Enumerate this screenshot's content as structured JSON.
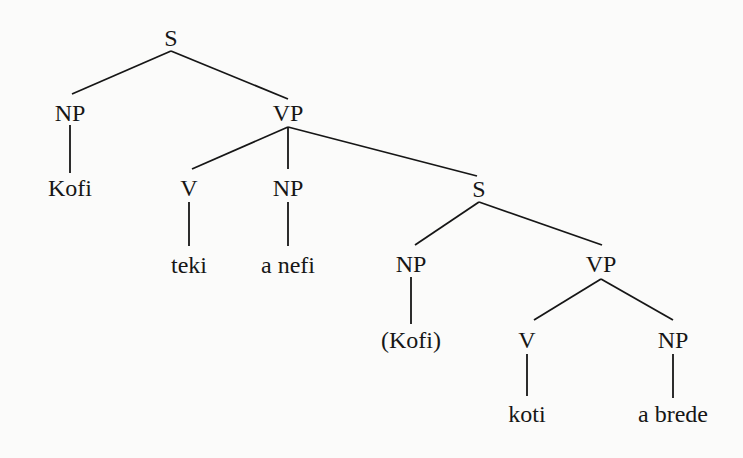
{
  "tree": {
    "nodes": [
      {
        "id": "s1",
        "label": "S",
        "x": 171,
        "y": 38
      },
      {
        "id": "np1",
        "label": "NP",
        "x": 70,
        "y": 113
      },
      {
        "id": "vp1",
        "label": "VP",
        "x": 288,
        "y": 113
      },
      {
        "id": "kofi1",
        "label": "Kofi",
        "x": 70,
        "y": 188
      },
      {
        "id": "v1",
        "label": "V",
        "x": 189,
        "y": 188
      },
      {
        "id": "np2",
        "label": "NP",
        "x": 288,
        "y": 188
      },
      {
        "id": "s2",
        "label": "S",
        "x": 479,
        "y": 189
      },
      {
        "id": "teki",
        "label": "teki",
        "x": 189,
        "y": 265
      },
      {
        "id": "anefi",
        "label": "a nefi",
        "x": 288,
        "y": 265
      },
      {
        "id": "np3",
        "label": "NP",
        "x": 411,
        "y": 264
      },
      {
        "id": "vp2",
        "label": "VP",
        "x": 601,
        "y": 264
      },
      {
        "id": "kofi2",
        "label": "(Kofi)",
        "x": 411,
        "y": 340
      },
      {
        "id": "v2",
        "label": "V",
        "x": 527,
        "y": 340
      },
      {
        "id": "np4",
        "label": "NP",
        "x": 673,
        "y": 340
      },
      {
        "id": "koti",
        "label": "koti",
        "x": 527,
        "y": 414
      },
      {
        "id": "abrede",
        "label": "a brede",
        "x": 673,
        "y": 414
      }
    ],
    "edges": [
      {
        "x1": 171,
        "y1": 51,
        "x2": 72,
        "y2": 94
      },
      {
        "x1": 171,
        "y1": 51,
        "x2": 288,
        "y2": 99
      },
      {
        "x1": 70,
        "y1": 125,
        "x2": 70,
        "y2": 173
      },
      {
        "x1": 288,
        "y1": 127,
        "x2": 192,
        "y2": 169
      },
      {
        "x1": 288,
        "y1": 127,
        "x2": 288,
        "y2": 169
      },
      {
        "x1": 288,
        "y1": 127,
        "x2": 477,
        "y2": 176
      },
      {
        "x1": 189,
        "y1": 202,
        "x2": 189,
        "y2": 246
      },
      {
        "x1": 288,
        "y1": 202,
        "x2": 288,
        "y2": 246
      },
      {
        "x1": 479,
        "y1": 202,
        "x2": 415,
        "y2": 245
      },
      {
        "x1": 479,
        "y1": 202,
        "x2": 602,
        "y2": 245
      },
      {
        "x1": 411,
        "y1": 277,
        "x2": 411,
        "y2": 324
      },
      {
        "x1": 601,
        "y1": 279,
        "x2": 534,
        "y2": 320
      },
      {
        "x1": 601,
        "y1": 279,
        "x2": 673,
        "y2": 320
      },
      {
        "x1": 527,
        "y1": 354,
        "x2": 527,
        "y2": 396
      },
      {
        "x1": 673,
        "y1": 354,
        "x2": 673,
        "y2": 398
      }
    ]
  }
}
